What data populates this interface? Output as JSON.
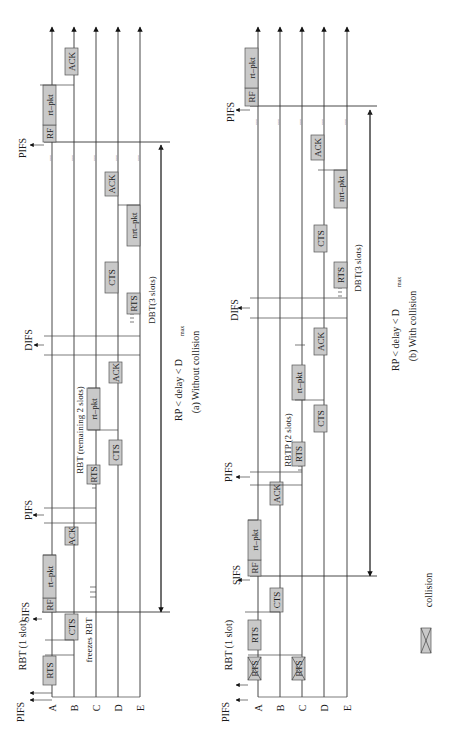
{
  "figure": {
    "stations": [
      "A",
      "B",
      "C",
      "D",
      "E"
    ],
    "panels": [
      {
        "id": "a",
        "caption": "(a) Without collision",
        "range_label": "RP < delay < D",
        "range_sub": "max",
        "interframe_labels": {
          "pifs_start": "PIFS",
          "sifs": "SIFS",
          "pifs_mid": "PIFS",
          "difs": "DIFS",
          "pifs_end": "PIFS"
        },
        "annotations": {
          "rbt1": "RBT (1 slot)",
          "freezes": "freezes RBT",
          "rbt_remaining": "RBT (remaining 2 slots)",
          "dbt": "DBT(3 slots)"
        },
        "frames": {
          "rts": "RTS",
          "cts": "CTS",
          "rf": "RF",
          "rtpkt": "rt–pkt",
          "ack": "ACK",
          "nrtpkt": "nrt–pkt"
        },
        "ellipsis": "..."
      },
      {
        "id": "b",
        "caption": "(b) With collision",
        "range_label": "RP < delay < D",
        "range_sub": "max",
        "interframe_labels": {
          "pifs_start": "PIFS",
          "sifs": "SIFS",
          "pifs_mid": "PIFS",
          "difs": "DIFS",
          "pifs_end": "PIFS"
        },
        "annotations": {
          "rbt1": "RBT (1 slot)",
          "rbtp": "RBTP (2 slots)",
          "dbt": "DBT(3 slots)"
        },
        "frames": {
          "rts": "RTS",
          "cts": "CTS",
          "rf": "RF",
          "rtpkt": "rt–pkt",
          "ack": "ACK",
          "nrtpkt": "nrt–pkt"
        },
        "ellipsis": "..."
      }
    ],
    "legend": {
      "label": "collision",
      "icon": "collision-box-icon"
    }
  }
}
